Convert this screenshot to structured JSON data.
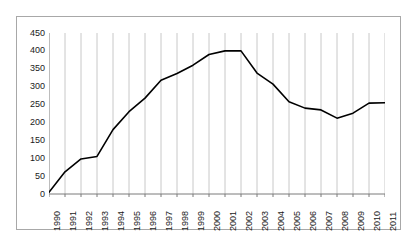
{
  "chart_data": {
    "type": "line",
    "title": "",
    "subtitle": "",
    "xlabel": "",
    "ylabel": "",
    "x": [
      1990,
      1991,
      1992,
      1993,
      1994,
      1995,
      1996,
      1997,
      1998,
      1999,
      2000,
      2001,
      2002,
      2003,
      2004,
      2005,
      2006,
      2007,
      2008,
      2009,
      2010,
      2011
    ],
    "categories": [
      "1990",
      "1991",
      "1992",
      "1993",
      "1994",
      "1995",
      "1996",
      "1997",
      "1998",
      "1999",
      "2000",
      "2001",
      "2002",
      "2003",
      "2004",
      "2005",
      "2006",
      "2007",
      "2008",
      "2009",
      "2010",
      "2011"
    ],
    "values": [
      5,
      62,
      98,
      105,
      180,
      230,
      268,
      318,
      337,
      360,
      390,
      400,
      400,
      338,
      307,
      258,
      240,
      235,
      212,
      226,
      254,
      255
    ],
    "series": [
      {
        "name": "",
        "values": [
          5,
          62,
          98,
          105,
          180,
          230,
          268,
          318,
          337,
          360,
          390,
          400,
          400,
          338,
          307,
          258,
          240,
          235,
          212,
          226,
          254,
          255
        ]
      }
    ],
    "ylim": [
      0,
      450
    ],
    "xlim": [
      1990,
      2011
    ],
    "y_ticks": [
      0,
      50,
      100,
      150,
      200,
      250,
      300,
      350,
      400,
      450
    ],
    "y_tick_labels": [
      "0",
      "50",
      "100",
      "150",
      "200",
      "250",
      "300",
      "350",
      "400",
      "450"
    ],
    "grid": "vertical",
    "grid_color": "#c8c8c8",
    "legend": "none",
    "line_color": "#000000",
    "line_width": 1.6,
    "axis_color": "#7a7a7a",
    "frame_color": "#a8a8a8",
    "background": "#ffffff",
    "annotations": []
  }
}
